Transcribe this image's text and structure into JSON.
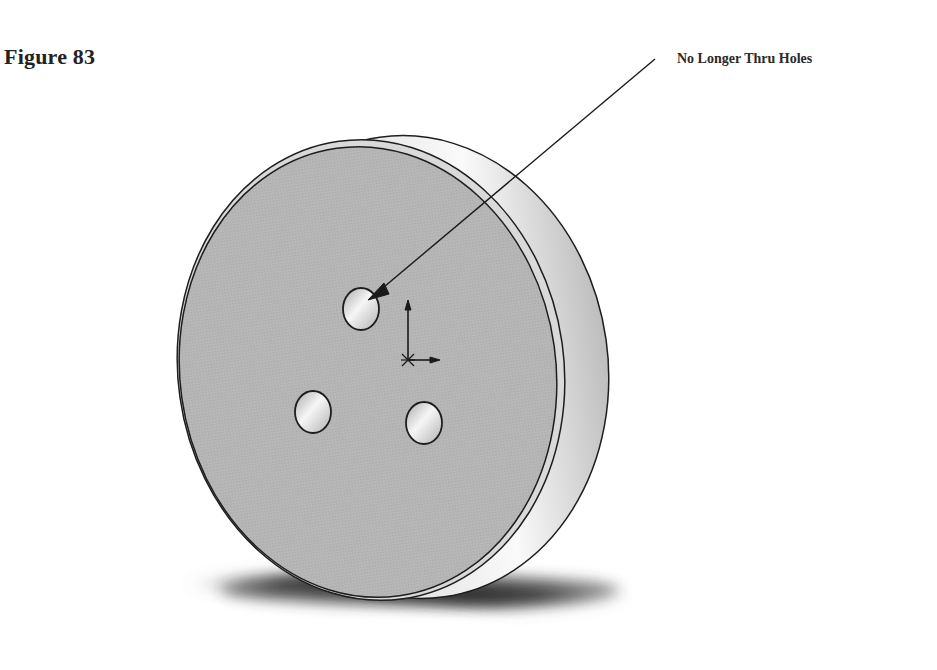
{
  "figure": {
    "title": "Figure 83"
  },
  "callout": {
    "label": "No Longer Thru Holes",
    "target": "top-hole"
  },
  "model": {
    "description": "3D shaded disk with three holes, origin triad at center",
    "hole_count": 3,
    "colors": {
      "face": "#b4b4b4",
      "rim": "#d8d8d8",
      "edge": "#1e1e1e",
      "shadow": "#2c2c2c",
      "hole_highlight": "#f4f4f4"
    }
  }
}
